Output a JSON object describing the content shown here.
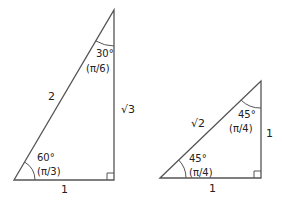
{
  "triangle_30_60_90": {
    "top_angle_deg": "30°",
    "top_angle_rad": "(π/6)",
    "bottom_angle_deg": "60°",
    "bottom_angle_rad": "(π/3)",
    "hypotenuse": "2",
    "vertical_side": "√3",
    "base": "1"
  },
  "triangle_45_45_90": {
    "top_angle_deg": "45°",
    "top_angle_rad": "(π/4)",
    "bottom_angle_deg": "45°",
    "bottom_angle_rad": "(π/4)",
    "hypotenuse": "√2",
    "vertical_side": "1",
    "base": "1"
  },
  "colors": {
    "line": "#555555",
    "text": "#222222"
  }
}
